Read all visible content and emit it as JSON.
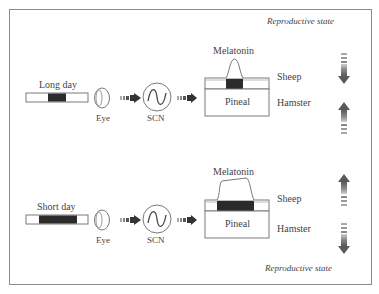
{
  "figure": {
    "title_top": "Reproductive state",
    "title_bottom": "Reproductive state",
    "panels": [
      {
        "id": "long-day",
        "photoperiod_label": "Long day",
        "eye_label": "Eye",
        "scn_label": "SCN",
        "melatonin_label": "Melatonin",
        "pineal_label": "Pineal",
        "species": [
          {
            "name": "Sheep",
            "reproductive_arrow": "down"
          },
          {
            "name": "Hamster",
            "reproductive_arrow": "up"
          }
        ],
        "melatonin_duration": "short"
      },
      {
        "id": "short-day",
        "photoperiod_label": "Short day",
        "eye_label": "Eye",
        "scn_label": "SCN",
        "melatonin_label": "Melatonin",
        "pineal_label": "Pineal",
        "species": [
          {
            "name": "Sheep",
            "reproductive_arrow": "up"
          },
          {
            "name": "Hamster",
            "reproductive_arrow": "down"
          }
        ],
        "melatonin_duration": "long"
      }
    ],
    "colors": {
      "dark_fill": "#2b2b2b",
      "arrow_fill": "#6a6a6a",
      "stroke": "#7a7a7a"
    }
  }
}
